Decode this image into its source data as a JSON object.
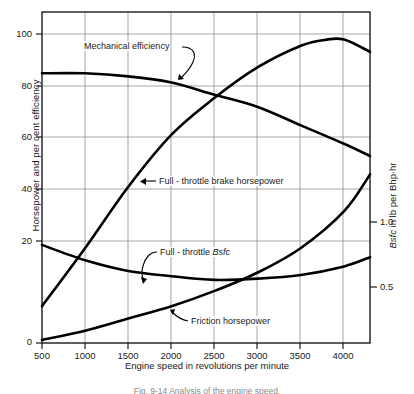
{
  "chart_data": {
    "type": "line",
    "title": "",
    "caption": "Fig. 9-14  Analysis of the engine speed.",
    "xlabel": "Engine speed in revolutions per minute",
    "ylabel_left": "Horsepower and per cent efficiency",
    "ylabel_right": "Bsfc in lb per Bhp·hr",
    "xlim": [
      500,
      4300
    ],
    "xticks": [
      500,
      1000,
      1500,
      2000,
      2500,
      3000,
      3500,
      4000
    ],
    "xtick_labels": [
      "500",
      "1000",
      "1500",
      "2000",
      "2500",
      "3000",
      "3500",
      "4000"
    ],
    "ylim_left": [
      0,
      108
    ],
    "yticks_left": [
      0,
      20,
      40,
      60,
      80,
      100
    ],
    "ytick_labels_left": [
      "0",
      "20",
      "40",
      "60",
      "80",
      "100"
    ],
    "ylim_right": [
      0.0,
      0.83
    ],
    "yticks_right": [
      0.5,
      1.0
    ],
    "ytick_labels_right": [
      "0.5",
      "1.0"
    ],
    "right_axis_mapping": "left_value_20_equals_0.5 ; left_value_40_equals_1.0",
    "grid": true,
    "legend_position": "inline-annotations",
    "line_color": "#000000",
    "grid_color": "#9a9a9a",
    "axis_color": "#1a1a1a",
    "series": [
      {
        "name": "Mechanical efficiency",
        "axis": "left",
        "units": "per cent",
        "x": [
          500,
          1000,
          1500,
          2000,
          2500,
          3000,
          3500,
          4000,
          4300
        ],
        "values": [
          88,
          88,
          87,
          85,
          81,
          77,
          71,
          65,
          61
        ]
      },
      {
        "name": "Full-throttle brake horsepower",
        "axis": "left",
        "units": "hp",
        "x": [
          500,
          1000,
          1500,
          2000,
          2500,
          3000,
          3500,
          3800,
          4000,
          4300
        ],
        "values": [
          12,
          31,
          51,
          68,
          80,
          90,
          97,
          99,
          99,
          95
        ]
      },
      {
        "name": "Full-throttle Bsfc",
        "axis": "right",
        "units": "lb per Bhp-hr",
        "x": [
          500,
          1000,
          1500,
          2000,
          2500,
          3000,
          3500,
          4000,
          4300
        ],
        "values": [
          0.8,
          0.67,
          0.59,
          0.545,
          0.515,
          0.525,
          0.555,
          0.625,
          0.7
        ],
        "left_scale_equivalent": [
          32,
          27,
          23.5,
          21.8,
          20.6,
          21,
          22.2,
          25,
          28
        ]
      },
      {
        "name": "Friction horsepower",
        "axis": "left",
        "units": "hp",
        "x": [
          500,
          1000,
          1500,
          2000,
          2500,
          3000,
          3500,
          4000,
          4300
        ],
        "values": [
          1,
          4,
          8,
          12,
          17,
          23,
          31,
          43,
          55
        ]
      }
    ],
    "annotations": [
      {
        "label": "Mechanical efficiency",
        "target_series": "Mechanical efficiency"
      },
      {
        "label": "Full-throttle brake horsepower",
        "target_series": "Full-throttle brake horsepower"
      },
      {
        "label": "Full-throttle Bsfc",
        "target_series": "Full-throttle Bsfc",
        "label_italic_part": "Bsfc"
      },
      {
        "label": "Friction horsepower",
        "target_series": "Friction horsepower"
      }
    ]
  },
  "annotation_text": {
    "mech_eff": "Mechanical efficiency",
    "brake_hp_prefix": "Full - throttle brake horsepower",
    "bsfc_prefix": "Full - throttle ",
    "bsfc_italic": "Bsfc",
    "friction_hp": "Friction horsepower"
  },
  "axis_text": {
    "xlabel": "Engine speed in revolutions per minute",
    "ylabel_left": "Horsepower and per cent efficiency",
    "ylabel_right_italic": "Bsfc",
    "ylabel_right_rest": " in lb per Bhp·hr"
  },
  "xticks": [
    "500",
    "1000",
    "1500",
    "2000",
    "2500",
    "3000",
    "3500",
    "4000"
  ],
  "yticks_left": [
    "100",
    "80",
    "60",
    "40",
    "20",
    "0"
  ],
  "yticks_right": [
    "1.0",
    "0.5"
  ],
  "caption": "Fig. 9-14  Analysis of the engine speed."
}
